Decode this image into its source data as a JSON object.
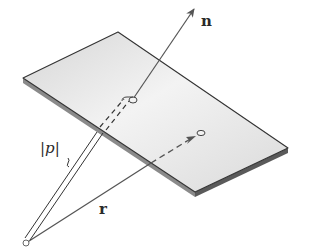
{
  "diagram": {
    "type": "plane-normal-vector",
    "labels": {
      "normal": "n",
      "position_vector": "r",
      "distance": "|p|"
    },
    "elements": [
      "plane",
      "normal-vector-n",
      "position-vector-r",
      "distance-brace-p",
      "origin-point",
      "foot-of-normal-point",
      "point-on-plane"
    ],
    "colors": {
      "plane_fill_light": "#f4f4f4",
      "plane_fill_dark": "#cfcfcf",
      "plane_edge": "#3a3a3a",
      "line": "#555555"
    }
  }
}
